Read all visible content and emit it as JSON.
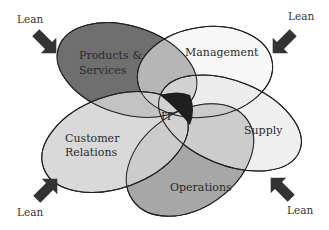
{
  "diagram": {
    "type": "overlapping-ellipses",
    "center_label": "IT",
    "regions": [
      {
        "id": "products-services",
        "label_line1": "Products &",
        "label_line2": "Services",
        "fill": "#6f6f6f"
      },
      {
        "id": "management",
        "label_line1": "Management",
        "fill": "#f3f3f3"
      },
      {
        "id": "supply",
        "label_line1": "Supply",
        "fill": "#e9e9e9"
      },
      {
        "id": "operations",
        "label_line1": "Operations",
        "fill": "#8f8f8f"
      },
      {
        "id": "customer-relations",
        "label_line1": "Customer",
        "label_line2": "Relations",
        "fill": "#d4d4d4"
      }
    ],
    "arrows": [
      {
        "position": "top-left",
        "label": "Lean",
        "icon": "arrow-down-right-icon"
      },
      {
        "position": "top-right",
        "label": "Lean",
        "icon": "arrow-down-left-icon"
      },
      {
        "position": "bottom-left",
        "label": "Lean",
        "icon": "arrow-up-right-icon"
      },
      {
        "position": "bottom-right",
        "label": "Lean",
        "icon": "arrow-up-left-icon"
      }
    ],
    "colors": {
      "outline": "#222222",
      "arrow": "#333333",
      "it_highlight": "#1e1e1e"
    }
  }
}
